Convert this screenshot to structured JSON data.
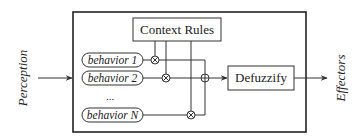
{
  "diagram": {
    "input_label": "Perception",
    "output_label": "Effectors",
    "context_rules_label": "Context Rules",
    "defuzzify_label": "Defuzzify",
    "behaviors": [
      {
        "label": "behavior 1"
      },
      {
        "label": "behavior 2"
      },
      {
        "label": "behavior N"
      }
    ],
    "ellipsis": "...",
    "multiply_symbol": "⊗",
    "sum_symbol": "⊕"
  }
}
